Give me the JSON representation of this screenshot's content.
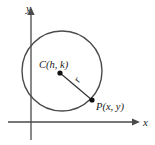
{
  "figure": {
    "background_color": "#ffffff",
    "stroke_color": "#4a4a4a",
    "axis_color": "#4a4a4a",
    "label_color": "#1a1a1a"
  },
  "axes": {
    "x_label": "x",
    "y_label": "y",
    "x_axis": {
      "x1": 8,
      "y1": 122,
      "x2": 133,
      "y2": 122
    },
    "y_axis": {
      "x1": 31,
      "y1": 140,
      "x2": 31,
      "y2": 10
    },
    "x_label_pos": {
      "x": 143,
      "y": 126
    },
    "y_label_pos": {
      "x": 26,
      "y": 12
    }
  },
  "circle": {
    "center": {
      "x": 62,
      "y": 71
    },
    "radius": 40,
    "stroke_width": 1.4
  },
  "center_point": {
    "label": "C(h, k)",
    "dot": {
      "x": 60,
      "y": 73,
      "r": 2.6
    },
    "label_pos": {
      "x": 39,
      "y": 68
    }
  },
  "outer_point": {
    "label": "P(x, y)",
    "dot": {
      "x": 92,
      "y": 100,
      "r": 2.6
    },
    "label_pos": {
      "x": 96,
      "y": 110
    }
  },
  "radius_segment": {
    "label": "r",
    "from": {
      "x": 60,
      "y": 73
    },
    "to": {
      "x": 92,
      "y": 100
    },
    "label_pos": {
      "x": 79,
      "y": 83
    },
    "label_rotation": -62
  }
}
